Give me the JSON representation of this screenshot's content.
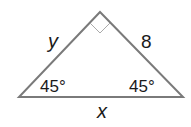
{
  "diagram": {
    "type": "right-isosceles-triangle",
    "labels": {
      "left_leg": "y",
      "right_leg": "8",
      "hypotenuse": "x",
      "left_angle": "45°",
      "right_angle": "45°"
    },
    "right_angle_marker": true,
    "colors": {
      "stroke": "#7a7a7a",
      "text": "#1a1a1a",
      "background": "#ffffff"
    }
  }
}
